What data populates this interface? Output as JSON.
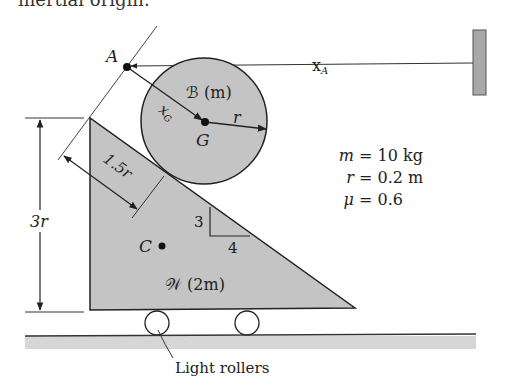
{
  "header": {
    "partial_text": "inertial origin."
  },
  "diagram": {
    "point_A_label": "A",
    "position_xA_label": "x",
    "position_xA_sub": "A",
    "body_B_label": "ℬ (m)",
    "xG_label": "x",
    "xG_sub": "G",
    "radius_label": "r",
    "center_G_label": "G",
    "offset_label": "1.5r",
    "height_label": "3r",
    "slope_rise": "3",
    "slope_run": "4",
    "center_C_label": "C",
    "wedge_label": "𝒲 (2m)",
    "rollers_label": "Light rollers"
  },
  "parameters": [
    {
      "symbol": "m",
      "value": "= 10 kg"
    },
    {
      "symbol": "r",
      "value": "= 0.2 m"
    },
    {
      "symbol": "μ",
      "value": "= 0.6"
    }
  ],
  "colors": {
    "fill_gray": "#c4c4c4",
    "line": "#222222",
    "wall": "#a8a8a8",
    "ground": "#d6d6d6"
  }
}
